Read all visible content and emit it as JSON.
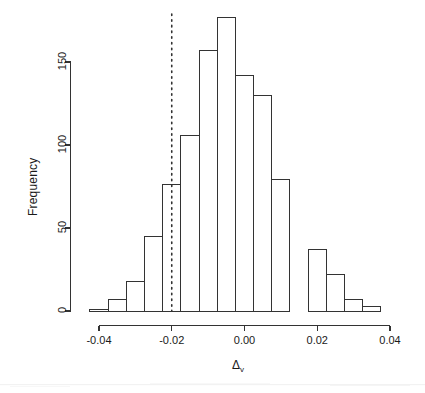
{
  "figure": {
    "title": "",
    "background": "#ffffff",
    "ink_color": "#333333",
    "width": 425,
    "height": 393
  },
  "axes": {
    "y": {
      "label": "Frequency",
      "ticks": [
        0,
        50,
        100,
        150
      ],
      "tick_labels": [
        "0",
        "50",
        "100",
        "150"
      ],
      "range": [
        0,
        155
      ]
    },
    "x": {
      "label_delta": "Δ",
      "label_sub": "v",
      "ticks": [
        -0.04,
        -0.02,
        0.0,
        0.02,
        0.04
      ],
      "tick_labels": [
        "-0.04",
        "-0.02",
        "0.00",
        "0.02",
        "0.04"
      ],
      "range": [
        -0.0425,
        0.0455
      ]
    }
  },
  "reference_line": {
    "name": "vertical-dotted-reference-line",
    "x_value": -0.02,
    "style": "dotted",
    "color": "#1a1a1a"
  },
  "chart_data": {
    "type": "bar",
    "title": "",
    "xlabel": "Δv",
    "ylabel": "Frequency",
    "xlim": [
      -0.0425,
      0.0455
    ],
    "ylim": [
      0,
      155
    ],
    "grid": false,
    "legend": null,
    "bin_width": 0.005,
    "bin_edges": [
      -0.0425,
      -0.0375,
      -0.0325,
      -0.0275,
      -0.0225,
      -0.0175,
      -0.0125,
      -0.0075,
      -0.0025,
      0.0025,
      0.0075,
      0.0125,
      0.0175,
      0.0225,
      0.0275,
      0.0325,
      0.0375,
      0.0425,
      0.0455
    ],
    "categories": [
      "-0.0425",
      "-0.0375",
      "-0.0325",
      "-0.0275",
      "-0.0225",
      "-0.0175",
      "-0.0125",
      "-0.0075",
      "-0.0025",
      "0.0025",
      "0.0075",
      "0.0125",
      "0.0175",
      "0.0225",
      "0.0275",
      "0.0325",
      "0.0375",
      "0.0425"
    ],
    "values": [
      1,
      7,
      18,
      45,
      76,
      106,
      157,
      177,
      142,
      130,
      79,
      0,
      37,
      22,
      7,
      3,
      0,
      0
    ],
    "bars": [
      {
        "x0": -0.0425,
        "x1": -0.0375,
        "value": 1
      },
      {
        "x0": -0.0375,
        "x1": -0.0325,
        "value": 7
      },
      {
        "x0": -0.0325,
        "x1": -0.0275,
        "value": 18
      },
      {
        "x0": -0.0275,
        "x1": -0.0225,
        "value": 45
      },
      {
        "x0": -0.0225,
        "x1": -0.0175,
        "value": 76
      },
      {
        "x0": -0.0175,
        "x1": -0.0125,
        "value": 106
      },
      {
        "x0": -0.0125,
        "x1": -0.0075,
        "value": 157
      },
      {
        "x0": -0.0075,
        "x1": -0.0025,
        "value": 177
      },
      {
        "x0": -0.0025,
        "x1": 0.0025,
        "value": 142
      },
      {
        "x0": 0.0025,
        "x1": 0.0075,
        "value": 130
      },
      {
        "x0": 0.0075,
        "x1": 0.0125,
        "value": 79
      },
      {
        "x0": 0.0175,
        "x1": 0.0225,
        "value": 37
      },
      {
        "x0": 0.0225,
        "x1": 0.0275,
        "value": 22
      },
      {
        "x0": 0.0275,
        "x1": 0.0325,
        "value": 7
      },
      {
        "x0": 0.0325,
        "x1": 0.0375,
        "value": 3
      }
    ]
  }
}
